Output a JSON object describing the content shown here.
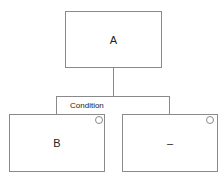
{
  "diagram": {
    "type": "decision-tree",
    "root": {
      "label": "A"
    },
    "edge": {
      "label": "Condition"
    },
    "children": [
      {
        "label": "B",
        "has_toggle_circle": true
      },
      {
        "label": "–",
        "has_toggle_circle": true
      }
    ]
  },
  "colors": {
    "stroke": "#8a8a8a",
    "text": "#222222",
    "background": "#ffffff"
  }
}
